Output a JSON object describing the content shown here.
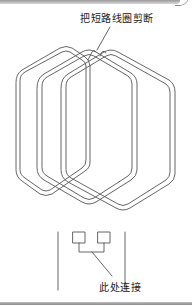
{
  "diagram": {
    "type": "coil-winding-illustration",
    "annotations": {
      "top": "把短路线圈剪断",
      "bottom": "此处连接"
    },
    "elements": {
      "coils": 3,
      "lead_terminals": 2,
      "line_color": "#555555",
      "background": "#ffffff"
    }
  }
}
